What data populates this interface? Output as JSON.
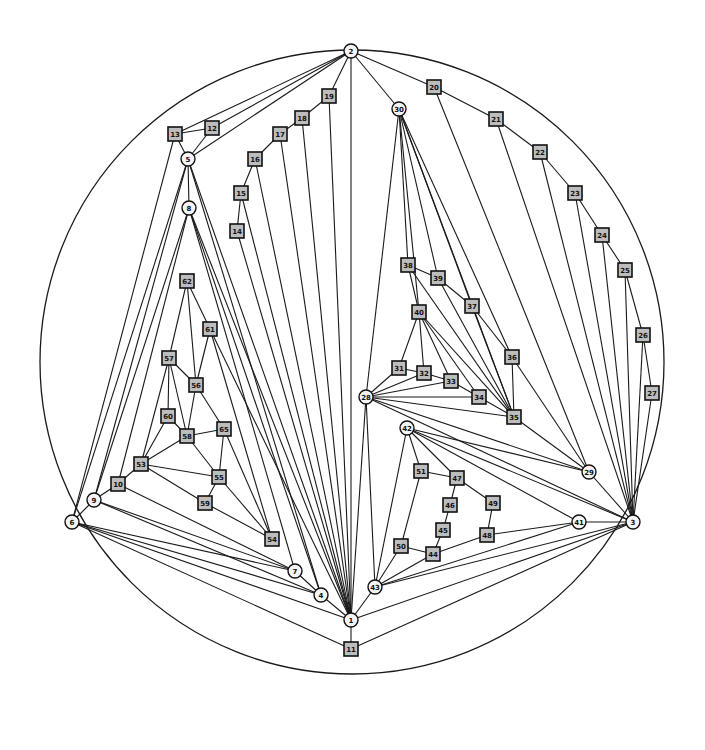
{
  "diagram": {
    "type": "planar-graph",
    "outer_circle": {
      "cx": 352,
      "cy": 362,
      "r": 312
    },
    "nodes": [
      {
        "id": "1",
        "shape": "circle",
        "x": 351,
        "y": 620
      },
      {
        "id": "2",
        "shape": "circle",
        "x": 351,
        "y": 51
      },
      {
        "id": "3",
        "shape": "circle",
        "x": 633,
        "y": 522
      },
      {
        "id": "4",
        "shape": "circle",
        "x": 321,
        "y": 595
      },
      {
        "id": "5",
        "shape": "circle",
        "x": 188,
        "y": 159
      },
      {
        "id": "6",
        "shape": "circle",
        "x": 72,
        "y": 522
      },
      {
        "id": "7",
        "shape": "circle",
        "x": 295,
        "y": 571
      },
      {
        "id": "8",
        "shape": "circle",
        "x": 189,
        "y": 208
      },
      {
        "id": "9",
        "shape": "circle",
        "x": 94,
        "y": 500
      },
      {
        "id": "10",
        "shape": "square",
        "x": 118,
        "y": 484
      },
      {
        "id": "11",
        "shape": "square",
        "x": 351,
        "y": 649
      },
      {
        "id": "12",
        "shape": "square",
        "x": 212,
        "y": 128
      },
      {
        "id": "13",
        "shape": "square",
        "x": 175,
        "y": 134
      },
      {
        "id": "14",
        "shape": "square",
        "x": 237,
        "y": 231
      },
      {
        "id": "15",
        "shape": "square",
        "x": 241,
        "y": 193
      },
      {
        "id": "16",
        "shape": "square",
        "x": 255,
        "y": 159
      },
      {
        "id": "17",
        "shape": "square",
        "x": 280,
        "y": 134
      },
      {
        "id": "18",
        "shape": "square",
        "x": 302,
        "y": 118
      },
      {
        "id": "19",
        "shape": "square",
        "x": 329,
        "y": 96
      },
      {
        "id": "20",
        "shape": "square",
        "x": 434,
        "y": 87
      },
      {
        "id": "21",
        "shape": "square",
        "x": 496,
        "y": 119
      },
      {
        "id": "22",
        "shape": "square",
        "x": 540,
        "y": 152
      },
      {
        "id": "23",
        "shape": "square",
        "x": 575,
        "y": 193
      },
      {
        "id": "24",
        "shape": "square",
        "x": 602,
        "y": 235
      },
      {
        "id": "25",
        "shape": "square",
        "x": 625,
        "y": 270
      },
      {
        "id": "26",
        "shape": "square",
        "x": 643,
        "y": 335
      },
      {
        "id": "27",
        "shape": "square",
        "x": 652,
        "y": 393
      },
      {
        "id": "28",
        "shape": "circle",
        "x": 366,
        "y": 397
      },
      {
        "id": "29",
        "shape": "circle",
        "x": 589,
        "y": 472
      },
      {
        "id": "30",
        "shape": "circle",
        "x": 399,
        "y": 109
      },
      {
        "id": "31",
        "shape": "square",
        "x": 399,
        "y": 368
      },
      {
        "id": "32",
        "shape": "square",
        "x": 424,
        "y": 373
      },
      {
        "id": "33",
        "shape": "square",
        "x": 451,
        "y": 381
      },
      {
        "id": "34",
        "shape": "square",
        "x": 479,
        "y": 397
      },
      {
        "id": "35",
        "shape": "square",
        "x": 514,
        "y": 417
      },
      {
        "id": "36",
        "shape": "square",
        "x": 512,
        "y": 357
      },
      {
        "id": "37",
        "shape": "square",
        "x": 472,
        "y": 306
      },
      {
        "id": "38",
        "shape": "square",
        "x": 408,
        "y": 265
      },
      {
        "id": "39",
        "shape": "square",
        "x": 438,
        "y": 278
      },
      {
        "id": "40",
        "shape": "square",
        "x": 419,
        "y": 312
      },
      {
        "id": "41",
        "shape": "circle",
        "x": 579,
        "y": 522
      },
      {
        "id": "42",
        "shape": "circle",
        "x": 407,
        "y": 428
      },
      {
        "id": "43",
        "shape": "circle",
        "x": 375,
        "y": 587
      },
      {
        "id": "44",
        "shape": "square",
        "x": 433,
        "y": 554
      },
      {
        "id": "45",
        "shape": "square",
        "x": 443,
        "y": 530
      },
      {
        "id": "46",
        "shape": "square",
        "x": 450,
        "y": 505
      },
      {
        "id": "47",
        "shape": "square",
        "x": 457,
        "y": 478
      },
      {
        "id": "48",
        "shape": "square",
        "x": 487,
        "y": 535
      },
      {
        "id": "49",
        "shape": "square",
        "x": 493,
        "y": 503
      },
      {
        "id": "50",
        "shape": "square",
        "x": 401,
        "y": 546
      },
      {
        "id": "51",
        "shape": "square",
        "x": 421,
        "y": 471
      },
      {
        "id": "53",
        "shape": "square",
        "x": 141,
        "y": 464
      },
      {
        "id": "54",
        "shape": "square",
        "x": 272,
        "y": 539
      },
      {
        "id": "55",
        "shape": "square",
        "x": 219,
        "y": 477
      },
      {
        "id": "56",
        "shape": "square",
        "x": 196,
        "y": 385
      },
      {
        "id": "57",
        "shape": "square",
        "x": 169,
        "y": 358
      },
      {
        "id": "58",
        "shape": "square",
        "x": 187,
        "y": 436
      },
      {
        "id": "59",
        "shape": "square",
        "x": 205,
        "y": 503
      },
      {
        "id": "60",
        "shape": "square",
        "x": 168,
        "y": 416
      },
      {
        "id": "61",
        "shape": "square",
        "x": 210,
        "y": 329
      },
      {
        "id": "62",
        "shape": "square",
        "x": 187,
        "y": 281
      },
      {
        "id": "65",
        "shape": "square",
        "x": 224,
        "y": 429
      }
    ],
    "edges": [
      [
        "2",
        "13"
      ],
      [
        "2",
        "12"
      ],
      [
        "2",
        "5"
      ],
      [
        "2",
        "19"
      ],
      [
        "2",
        "1"
      ],
      [
        "2",
        "30"
      ],
      [
        "2",
        "20"
      ],
      [
        "13",
        "12"
      ],
      [
        "13",
        "5"
      ],
      [
        "12",
        "5"
      ],
      [
        "13",
        "6"
      ],
      [
        "19",
        "18"
      ],
      [
        "18",
        "17"
      ],
      [
        "17",
        "16"
      ],
      [
        "16",
        "15"
      ],
      [
        "15",
        "14"
      ],
      [
        "19",
        "1"
      ],
      [
        "18",
        "1"
      ],
      [
        "17",
        "1"
      ],
      [
        "16",
        "1"
      ],
      [
        "15",
        "1"
      ],
      [
        "14",
        "1"
      ],
      [
        "5",
        "8"
      ],
      [
        "5",
        "6"
      ],
      [
        "5",
        "9"
      ],
      [
        "5",
        "1"
      ],
      [
        "5",
        "4"
      ],
      [
        "8",
        "10"
      ],
      [
        "8",
        "9"
      ],
      [
        "8",
        "1"
      ],
      [
        "8",
        "4"
      ],
      [
        "8",
        "7"
      ],
      [
        "62",
        "57"
      ],
      [
        "62",
        "56"
      ],
      [
        "62",
        "61"
      ],
      [
        "61",
        "56"
      ],
      [
        "61",
        "54"
      ],
      [
        "61",
        "1"
      ],
      [
        "57",
        "60"
      ],
      [
        "57",
        "58"
      ],
      [
        "57",
        "56"
      ],
      [
        "57",
        "53"
      ],
      [
        "56",
        "58"
      ],
      [
        "56",
        "65"
      ],
      [
        "60",
        "58"
      ],
      [
        "60",
        "53"
      ],
      [
        "58",
        "53"
      ],
      [
        "58",
        "65"
      ],
      [
        "58",
        "55"
      ],
      [
        "65",
        "55"
      ],
      [
        "65",
        "54"
      ],
      [
        "53",
        "55"
      ],
      [
        "53",
        "59"
      ],
      [
        "53",
        "10"
      ],
      [
        "55",
        "59"
      ],
      [
        "55",
        "54"
      ],
      [
        "59",
        "54"
      ],
      [
        "10",
        "9"
      ],
      [
        "10",
        "7"
      ],
      [
        "9",
        "6"
      ],
      [
        "9",
        "7"
      ],
      [
        "9",
        "4"
      ],
      [
        "6",
        "7"
      ],
      [
        "6",
        "4"
      ],
      [
        "6",
        "1"
      ],
      [
        "6",
        "11"
      ],
      [
        "7",
        "4"
      ],
      [
        "4",
        "1"
      ],
      [
        "1",
        "11"
      ],
      [
        "11",
        "3"
      ],
      [
        "1",
        "43"
      ],
      [
        "1",
        "3"
      ],
      [
        "1",
        "28"
      ],
      [
        "30",
        "38"
      ],
      [
        "30",
        "28"
      ],
      [
        "30",
        "39"
      ],
      [
        "30",
        "37"
      ],
      [
        "30",
        "36"
      ],
      [
        "30",
        "35"
      ],
      [
        "30",
        "40"
      ],
      [
        "20",
        "21"
      ],
      [
        "21",
        "22"
      ],
      [
        "22",
        "23"
      ],
      [
        "23",
        "24"
      ],
      [
        "24",
        "25"
      ],
      [
        "25",
        "26"
      ],
      [
        "26",
        "27"
      ],
      [
        "20",
        "29"
      ],
      [
        "21",
        "3"
      ],
      [
        "22",
        "3"
      ],
      [
        "23",
        "3"
      ],
      [
        "24",
        "3"
      ],
      [
        "25",
        "3"
      ],
      [
        "26",
        "3"
      ],
      [
        "27",
        "3"
      ],
      [
        "38",
        "39"
      ],
      [
        "39",
        "37"
      ],
      [
        "37",
        "36"
      ],
      [
        "38",
        "40"
      ],
      [
        "38",
        "35"
      ],
      [
        "39",
        "35"
      ],
      [
        "37",
        "35"
      ],
      [
        "36",
        "35"
      ],
      [
        "36",
        "29"
      ],
      [
        "40",
        "31"
      ],
      [
        "40",
        "32"
      ],
      [
        "40",
        "33"
      ],
      [
        "40",
        "34"
      ],
      [
        "40",
        "35"
      ],
      [
        "28",
        "31"
      ],
      [
        "28",
        "32"
      ],
      [
        "28",
        "33"
      ],
      [
        "28",
        "34"
      ],
      [
        "28",
        "35"
      ],
      [
        "28",
        "29"
      ],
      [
        "28",
        "3"
      ],
      [
        "28",
        "43"
      ],
      [
        "31",
        "32"
      ],
      [
        "32",
        "33"
      ],
      [
        "33",
        "34"
      ],
      [
        "34",
        "35"
      ],
      [
        "35",
        "29"
      ],
      [
        "42",
        "51"
      ],
      [
        "42",
        "47"
      ],
      [
        "42",
        "29"
      ],
      [
        "42",
        "41"
      ],
      [
        "42",
        "3"
      ],
      [
        "42",
        "43"
      ],
      [
        "51",
        "47"
      ],
      [
        "51",
        "50"
      ],
      [
        "47",
        "46"
      ],
      [
        "47",
        "49"
      ],
      [
        "46",
        "45"
      ],
      [
        "45",
        "44"
      ],
      [
        "49",
        "48"
      ],
      [
        "48",
        "44"
      ],
      [
        "48",
        "41"
      ],
      [
        "50",
        "44"
      ],
      [
        "50",
        "43"
      ],
      [
        "44",
        "43"
      ],
      [
        "43",
        "41"
      ],
      [
        "43",
        "3"
      ],
      [
        "41",
        "3"
      ],
      [
        "29",
        "3"
      ]
    ]
  }
}
